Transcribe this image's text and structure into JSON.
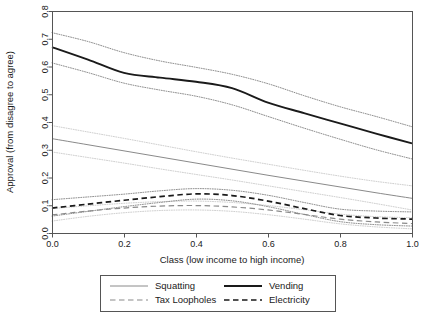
{
  "chart_data": {
    "type": "line",
    "title": "",
    "xlabel": "Class (low income to high income)",
    "ylabel": "Approval (from disagree to agree)",
    "xlim": [
      0.0,
      1.0
    ],
    "ylim": [
      0.0,
      0.8
    ],
    "xticks": [
      "0.0",
      "0.2",
      "0.4",
      "0.6",
      "0.8",
      "1.0"
    ],
    "xtick_values": [
      0.0,
      0.2,
      0.4,
      0.6,
      0.8,
      1.0
    ],
    "yticks": [
      "0.0",
      "0.1",
      "0.2",
      "0.3",
      "0.4",
      "0.5",
      "0.6",
      "0.7",
      "0.8"
    ],
    "ytick_values": [
      0.0,
      0.1,
      0.2,
      0.3,
      0.4,
      0.5,
      0.6,
      0.7,
      0.8
    ],
    "grid": false,
    "legend_position": "below-plot",
    "x": [
      0.0,
      0.1,
      0.2,
      0.3,
      0.4,
      0.5,
      0.6,
      0.7,
      0.8,
      0.9,
      1.0
    ],
    "series": [
      {
        "name": "Vending",
        "style": "solid",
        "color": "#1a1a1a",
        "width": 1.9,
        "values": [
          0.67,
          0.625,
          0.577,
          0.56,
          0.545,
          0.522,
          0.47,
          0.432,
          0.395,
          0.358,
          0.323
        ],
        "ci_upper": [
          0.722,
          0.69,
          0.65,
          0.62,
          0.597,
          0.572,
          0.538,
          0.495,
          0.455,
          0.42,
          0.383
        ],
        "ci_lower": [
          0.613,
          0.578,
          0.54,
          0.515,
          0.493,
          0.462,
          0.42,
          0.378,
          0.338,
          0.3,
          0.267
        ]
      },
      {
        "name": "Squatting",
        "style": "solid",
        "color": "#8a8a8a",
        "width": 1.0,
        "values": [
          0.34,
          0.318,
          0.296,
          0.274,
          0.252,
          0.23,
          0.208,
          0.187,
          0.166,
          0.145,
          0.125
        ],
        "ci_upper": [
          0.387,
          0.364,
          0.341,
          0.317,
          0.293,
          0.27,
          0.248,
          0.226,
          0.205,
          0.186,
          0.17
        ],
        "ci_lower": [
          0.292,
          0.272,
          0.252,
          0.231,
          0.211,
          0.191,
          0.17,
          0.149,
          0.128,
          0.106,
          0.083
        ]
      },
      {
        "name": "Electricity",
        "style": "dashed",
        "color": "#1a1a1a",
        "width": 1.7,
        "values": [
          0.09,
          0.104,
          0.118,
          0.131,
          0.141,
          0.135,
          0.115,
          0.088,
          0.063,
          0.054,
          0.05
        ],
        "ci_upper": [
          0.12,
          0.13,
          0.14,
          0.152,
          0.16,
          0.154,
          0.136,
          0.11,
          0.086,
          0.079,
          0.076
        ],
        "ci_lower": [
          0.061,
          0.078,
          0.095,
          0.11,
          0.122,
          0.116,
          0.095,
          0.067,
          0.041,
          0.03,
          0.025
        ]
      },
      {
        "name": "Tax Loopholes",
        "style": "dashed",
        "color": "#8a8a8a",
        "width": 1.2,
        "values": [
          0.065,
          0.079,
          0.09,
          0.097,
          0.099,
          0.094,
          0.083,
          0.067,
          0.05,
          0.04,
          0.034
        ],
        "ci_upper": [
          0.088,
          0.098,
          0.107,
          0.113,
          0.115,
          0.11,
          0.099,
          0.084,
          0.068,
          0.059,
          0.055
        ],
        "ci_lower": [
          0.043,
          0.06,
          0.073,
          0.081,
          0.083,
          0.078,
          0.066,
          0.05,
          0.033,
          0.022,
          0.015
        ]
      }
    ],
    "legend_entries": [
      {
        "label": "Squatting",
        "style": "solid",
        "color": "#8a8a8a",
        "width": 1.0
      },
      {
        "label": "Vending",
        "style": "solid",
        "color": "#1a1a1a",
        "width": 1.9
      },
      {
        "label": "Tax Loopholes",
        "style": "dashed",
        "color": "#8a8a8a",
        "width": 1.2
      },
      {
        "label": "Electricity",
        "style": "dashed",
        "color": "#1a1a1a",
        "width": 1.7
      }
    ]
  },
  "plot_geometry": {
    "left": 52,
    "right": 412,
    "top": 11,
    "bottom": 233
  },
  "legend_geometry": {
    "x": 100,
    "y": 275,
    "width": 235,
    "height": 36
  }
}
